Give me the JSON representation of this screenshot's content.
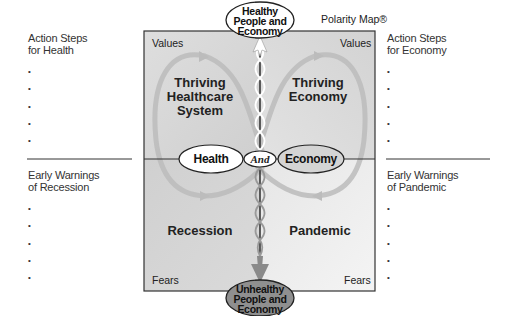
{
  "diagram": {
    "trademark": "Polarity Map®",
    "top_goal": [
      "Healthy",
      "People and",
      "Economy"
    ],
    "bottom_fear": [
      "Unhealthy",
      "People and",
      "Economy"
    ],
    "left_pole": "Health",
    "right_pole": "Economy",
    "connector": "And",
    "corner_labels": {
      "top_left": "Values",
      "top_right": "Values",
      "bottom_left": "Fears",
      "bottom_right": "Fears"
    },
    "quadrants": {
      "upper_left": [
        "Thriving",
        "Healthcare",
        "System"
      ],
      "upper_right": [
        "Thriving",
        "Economy"
      ],
      "lower_left": "Recession",
      "lower_right": "Pandemic"
    },
    "side_panels": {
      "action_steps_health": {
        "title": [
          "Action Steps",
          "for Health"
        ],
        "bullets": [
          "",
          "",
          "",
          "",
          ""
        ]
      },
      "action_steps_economy": {
        "title": [
          "Action Steps",
          "for Economy"
        ],
        "bullets": [
          "",
          "",
          "",
          "",
          ""
        ]
      },
      "warnings_recession": {
        "title": [
          "Early Warnings",
          "of Recession"
        ],
        "bullets": [
          "",
          "",
          "",
          "",
          ""
        ]
      },
      "warnings_pandemic": {
        "title": [
          "Early Warnings",
          "of Pandemic"
        ],
        "bullets": [
          "",
          "",
          "",
          "",
          ""
        ]
      }
    },
    "colors": {
      "upper_left_fill": "#d6d6d6",
      "upper_right_fill": "#dadada",
      "lower_left_fill": "#d2d2d2",
      "lower_right_fill": "#ededed",
      "frame": "#333333",
      "loop_arrow": "#bdbdbd",
      "bottom_ellipse_fill": "#8f8f8f"
    }
  }
}
